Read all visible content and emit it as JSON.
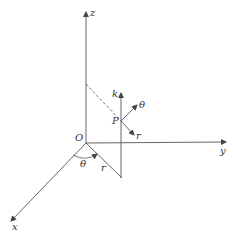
{
  "diagram": {
    "type": "3d-cylindrical-coordinates",
    "labels": {
      "z_axis": "z",
      "y_axis": "y",
      "x_axis": "x",
      "origin": "O",
      "point": "P",
      "k_vector": "k",
      "theta_vector": "θ",
      "r_vector": "r",
      "angle": "θ",
      "radius": "r"
    },
    "colors": {
      "line": "#555555",
      "text": "#333333"
    }
  }
}
